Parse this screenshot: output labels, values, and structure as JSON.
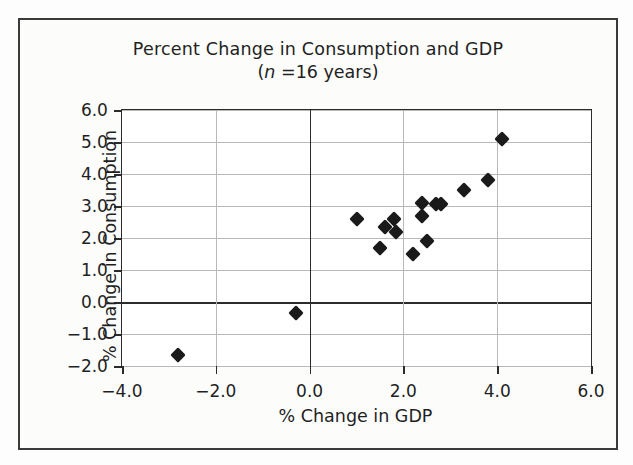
{
  "figure": {
    "title": "Percent Change in Consumption and GDP",
    "subtitle_prefix": "(",
    "subtitle_italic": "n",
    "subtitle_suffix": " =16 years)",
    "subtitle_plain": "(n =16 years)",
    "frame_color": "#3a3a3a",
    "background_color": "#fcfcfb"
  },
  "chart_data": {
    "type": "scatter",
    "title": "Percent Change in Consumption and GDP",
    "subtitle": "(n =16 years)",
    "xlabel": "% Change in GDP",
    "ylabel": "% Change in Consumption",
    "xlim": [
      -4.0,
      6.0
    ],
    "ylim": [
      -2.0,
      6.0
    ],
    "xticks": [
      -4.0,
      -2.0,
      0.0,
      2.0,
      4.0,
      6.0
    ],
    "yticks": [
      -2.0,
      -1.0,
      0.0,
      1.0,
      2.0,
      3.0,
      4.0,
      5.0,
      6.0
    ],
    "xtick_labels": [
      "-4.0",
      "-2.0",
      "0.0",
      "2.0",
      "4.0",
      "6.0"
    ],
    "ytick_labels": [
      "-2.0",
      "-1.0",
      "0.0",
      "1.0",
      "2.0",
      "3.0",
      "4.0",
      "5.0",
      "6.0"
    ],
    "grid": "horizontal-and-vertical",
    "legend": "none",
    "n": 16,
    "marker_style": "filled-diamond",
    "marker_color": "#1a1a1a",
    "points": [
      {
        "x": -2.8,
        "y": -1.65
      },
      {
        "x": -0.3,
        "y": -0.35
      },
      {
        "x": 1.0,
        "y": 2.6
      },
      {
        "x": 1.5,
        "y": 1.7
      },
      {
        "x": 1.6,
        "y": 2.35
      },
      {
        "x": 1.8,
        "y": 2.6
      },
      {
        "x": 1.85,
        "y": 2.2
      },
      {
        "x": 2.2,
        "y": 1.5
      },
      {
        "x": 2.4,
        "y": 3.1
      },
      {
        "x": 2.4,
        "y": 2.7
      },
      {
        "x": 2.5,
        "y": 1.9
      },
      {
        "x": 2.7,
        "y": 3.05
      },
      {
        "x": 2.8,
        "y": 3.05
      },
      {
        "x": 3.3,
        "y": 3.5
      },
      {
        "x": 3.8,
        "y": 3.8
      },
      {
        "x": 4.1,
        "y": 5.1
      }
    ]
  }
}
